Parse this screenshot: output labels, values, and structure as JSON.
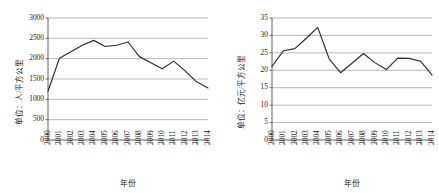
{
  "chart_data": [
    {
      "panel": "left",
      "type": "line",
      "title": "",
      "xlabel": "年份",
      "ylabel": "单位：人/平方公里",
      "ylim": [
        0,
        3000
      ],
      "yticks": [
        0,
        500,
        1000,
        1500,
        2000,
        2500,
        3000
      ],
      "grid": true,
      "legend": "none",
      "categories": [
        "2000",
        "2001",
        "2002",
        "2003",
        "2004",
        "2005",
        "2006",
        "2007",
        "2008",
        "2009",
        "2010",
        "2011",
        "2012",
        "2013",
        "2014"
      ],
      "values": [
        1200,
        2010,
        2170,
        2330,
        2450,
        2300,
        2330,
        2410,
        2050,
        1900,
        1750,
        1940,
        1700,
        1430,
        1280
      ]
    },
    {
      "panel": "right",
      "type": "line",
      "title": "",
      "xlabel": "年份",
      "ylabel": "单位：亿元/平方公里",
      "ylim": [
        0,
        35
      ],
      "yticks": [
        0,
        5,
        10,
        15,
        20,
        25,
        30,
        35
      ],
      "grid": true,
      "legend": "none",
      "categories": [
        "2000",
        "2001",
        "2002",
        "2003",
        "2004",
        "2005",
        "2006",
        "2007",
        "2008",
        "2009",
        "2010",
        "2011",
        "2012",
        "2013",
        "2014"
      ],
      "values": [
        21.1,
        25.6,
        26.2,
        29.2,
        32.3,
        23.3,
        19.3,
        22.0,
        24.8,
        22.2,
        20.2,
        23.5,
        23.4,
        22.6,
        18.6
      ]
    }
  ]
}
